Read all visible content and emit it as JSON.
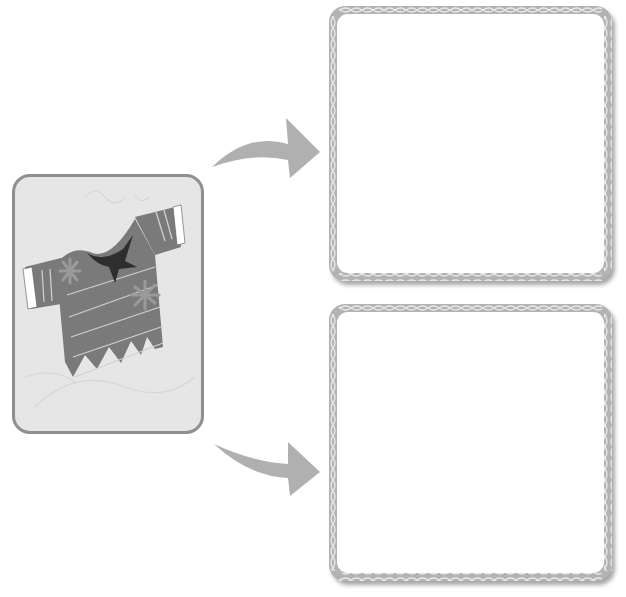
{
  "worksheet": {
    "picture_card": {
      "image_subject": "torn-shirt",
      "description": "Torn striped short-sleeve shirt with flower patterns and a dark hole at the collar",
      "background_color": "#e6e6e6",
      "border_color": "#8f8f8f",
      "shirt_color": "#7a7a7a",
      "hole_color": "#2e2e2e"
    },
    "arrows": [
      {
        "icon": "curved-arrow-right-up",
        "color": "#b0b0b0"
      },
      {
        "icon": "curved-arrow-right-down",
        "color": "#b0b0b0"
      }
    ],
    "answer_boxes": [
      {
        "label": "",
        "value": "",
        "frame_color": "#b3b3b3"
      },
      {
        "label": "",
        "value": "",
        "frame_color": "#b3b3b3"
      }
    ]
  }
}
